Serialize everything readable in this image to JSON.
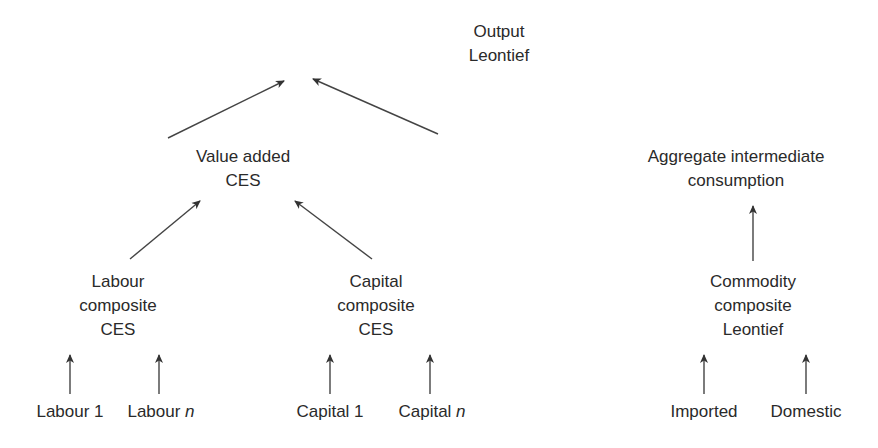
{
  "diagram": {
    "type": "production-function-nesting-tree",
    "nodes": {
      "output": {
        "line1": "Output",
        "line2": "Leontief"
      },
      "value_added": {
        "line1": "Value added",
        "line2": "CES"
      },
      "aggregate_intermediate": {
        "line1": "Aggregate intermediate",
        "line2": "consumption"
      },
      "labour_composite": {
        "line1": "Labour",
        "line2": "composite",
        "line3": "CES"
      },
      "capital_composite": {
        "line1": "Capital",
        "line2": "composite",
        "line3": "CES"
      },
      "commodity_composite": {
        "line1": "Commodity",
        "line2": "composite",
        "line3": "Leontief"
      }
    },
    "leaves": {
      "labour_1": {
        "text": "Labour 1"
      },
      "labour_n": {
        "text": "Labour ",
        "italic": "n"
      },
      "capital_1": {
        "text": "Capital 1"
      },
      "capital_n": {
        "text": "Capital ",
        "italic": "n"
      },
      "imported": {
        "text": "Imported"
      },
      "domestic": {
        "text": "Domestic"
      }
    },
    "edges": [
      {
        "from": "value_added",
        "to": "output"
      },
      {
        "from": "aggregate_intermediate",
        "to": "output"
      },
      {
        "from": "labour_composite",
        "to": "value_added"
      },
      {
        "from": "capital_composite",
        "to": "value_added"
      },
      {
        "from": "commodity_composite",
        "to": "aggregate_intermediate"
      },
      {
        "from": "labour_1",
        "to": "labour_composite"
      },
      {
        "from": "labour_n",
        "to": "labour_composite"
      },
      {
        "from": "capital_1",
        "to": "capital_composite"
      },
      {
        "from": "capital_n",
        "to": "capital_composite"
      },
      {
        "from": "imported",
        "to": "commodity_composite"
      },
      {
        "from": "domestic",
        "to": "commodity_composite"
      }
    ],
    "line_color": "#333333"
  }
}
